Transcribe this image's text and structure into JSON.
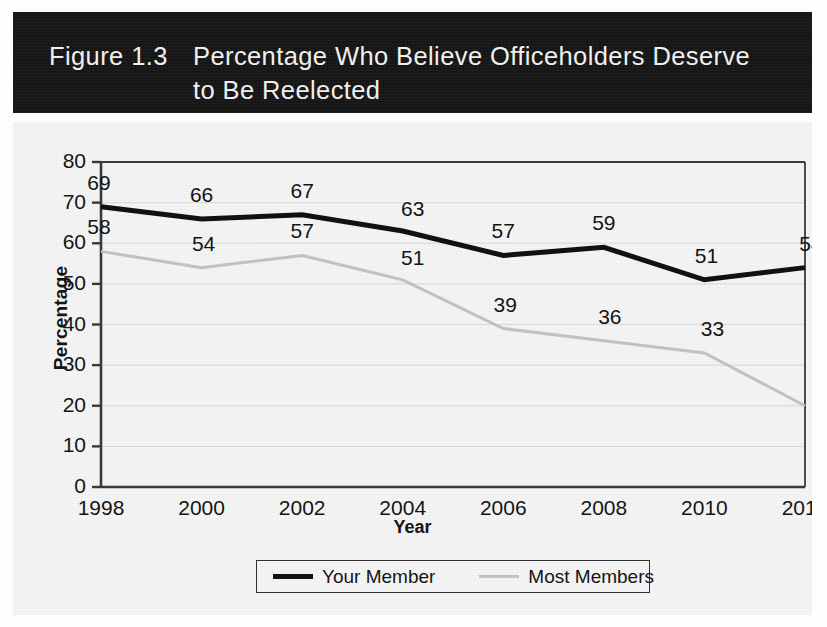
{
  "figure": {
    "number_label": "Figure 1.3",
    "title_line1": "Percentage Who Believe Officeholders Deserve",
    "title_line2": "to Be Reelected",
    "title_bar_color": "#151515",
    "title_text_color": "#efefef",
    "background_color": "#f4f4f4"
  },
  "chart_data": {
    "type": "line",
    "title": "Figure 1.3  Percentage Who Believe Officeholders Deserve to Be Reelected",
    "xlabel": "Year",
    "ylabel": "Percentage",
    "categories": [
      "1998",
      "2000",
      "2002",
      "2004",
      "2006",
      "2008",
      "2010",
      "2012"
    ],
    "x": [
      1998,
      2000,
      2002,
      2004,
      2006,
      2008,
      2010,
      2012
    ],
    "ylim": [
      0,
      80
    ],
    "yticks": [
      0,
      10,
      20,
      30,
      40,
      50,
      60,
      70,
      80
    ],
    "ytick_labels": [
      "0",
      "10",
      "20",
      "30",
      "40",
      "50",
      "60",
      "70",
      "80"
    ],
    "grid": true,
    "grid_axis": "y",
    "legend_position": "bottom",
    "series": [
      {
        "name": "Your Member",
        "color": "#111111",
        "line_width": 5,
        "values": [
          69,
          66,
          67,
          63,
          57,
          59,
          51,
          54
        ],
        "labels": [
          "69",
          "66",
          "67",
          "63",
          "57",
          "59",
          "51",
          "54"
        ]
      },
      {
        "name": "Most Members",
        "color": "#c2c2c2",
        "line_width": 3,
        "values": [
          58,
          54,
          57,
          51,
          39,
          36,
          33,
          20
        ],
        "labels": [
          "58",
          "54",
          "57",
          "51",
          "39",
          "36",
          "33",
          "20"
        ]
      }
    ]
  },
  "legend": {
    "entries": [
      {
        "label": "Your Member",
        "swatch": "thick-black-line"
      },
      {
        "label": "Most Members",
        "swatch": "thin-gray-line"
      }
    ]
  }
}
